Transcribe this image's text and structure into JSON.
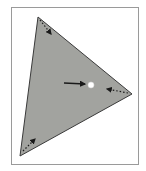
{
  "diagram": {
    "type": "triangle-centroid",
    "colors": {
      "background": "#ffffff",
      "frame_border": "#9a9a9a",
      "triangle_fill": "#a2a39f",
      "triangle_stroke": "#3a3a3a",
      "arrow": "#1a1a1a",
      "center_point": "#ffffff"
    },
    "triangle": {
      "vertices": [
        {
          "name": "top",
          "x": 38,
          "y": 17
        },
        {
          "name": "right",
          "x": 132,
          "y": 94
        },
        {
          "name": "bottom-left",
          "x": 20,
          "y": 156
        }
      ]
    },
    "center_point": {
      "x": 91,
      "y": 85,
      "r": 3
    },
    "pointer_arrow": {
      "x1": 64,
      "y1": 83,
      "x2": 85,
      "y2": 84
    },
    "vertex_arrows": [
      {
        "name": "top-vertex-arrow",
        "x1": 40,
        "y1": 20,
        "x2": 51,
        "y2": 34
      },
      {
        "name": "right-vertex-arrow",
        "x1": 128,
        "y1": 93,
        "x2": 107,
        "y2": 89
      },
      {
        "name": "bottom-vertex-arrow",
        "x1": 23,
        "y1": 151,
        "x2": 35,
        "y2": 139
      }
    ]
  }
}
